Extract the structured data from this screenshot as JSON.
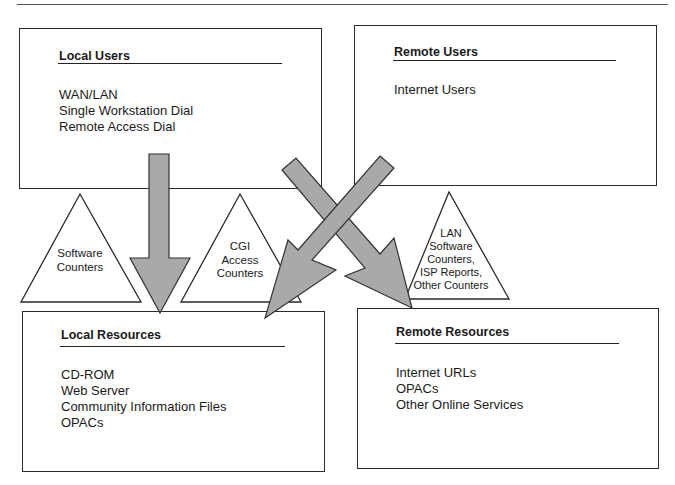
{
  "diagram": {
    "boxes": {
      "local_users": {
        "title": "Local Users",
        "items": [
          "WAN/LAN",
          "Single Workstation Dial",
          "Remote Access Dial"
        ]
      },
      "remote_users": {
        "title": "Remote Users",
        "items": [
          "Internet Users"
        ]
      },
      "local_resources": {
        "title": "Local Resources",
        "items": [
          "CD-ROM",
          "Web Server",
          "Community Information Files",
          "OPACs"
        ]
      },
      "remote_resources": {
        "title": "Remote Resources",
        "items": [
          "Internet URLs",
          "OPACs",
          "Other Online Services"
        ]
      }
    },
    "triangles": {
      "software": {
        "lines": [
          "Software",
          "Counters"
        ]
      },
      "cgi": {
        "lines": [
          "CGI",
          "Access",
          "Counters"
        ]
      },
      "lan": {
        "lines": [
          "LAN",
          "Software",
          "Counters,",
          "ISP Reports,",
          "Other Counters"
        ]
      }
    },
    "arrows": [
      {
        "from": "Local Users",
        "to": "Local Resources"
      },
      {
        "from": "Local Users",
        "to": "Remote Resources"
      },
      {
        "from": "Remote Users",
        "to": "Local Resources"
      }
    ],
    "colors": {
      "arrow_fill": "#a9a9a9",
      "arrow_stroke": "#333333",
      "line": "#2a2a2a",
      "background": "#ffffff"
    }
  }
}
